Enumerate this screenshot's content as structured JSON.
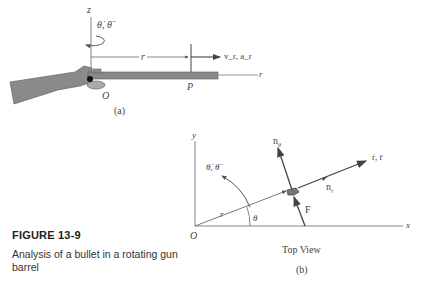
{
  "figure": {
    "number": "FIGURE 13-9",
    "caption": "Analysis of a bullet in a rotating gun barrel"
  },
  "part_a": {
    "label": "(a)",
    "z_axis": "z",
    "rotation": "θ̇, θ̈",
    "r_dim": "r",
    "point_p": "P",
    "origin": "O",
    "r_axis": "r",
    "velocity": "v_r, a_r"
  },
  "part_b": {
    "label": "(b)",
    "view": "Top View",
    "y_axis": "y",
    "x_axis": "x",
    "origin": "O",
    "r_line": "r",
    "theta": "θ",
    "rotation": "θ̇, θ̈",
    "n_theta": "n",
    "n_theta_sub": "θ",
    "n_r": "n",
    "n_r_sub": "r",
    "force": "F",
    "rdot": "ṙ, r̈"
  },
  "colors": {
    "line": "#555555",
    "gun": "#8a8a8a",
    "gun_dark": "#444444"
  }
}
